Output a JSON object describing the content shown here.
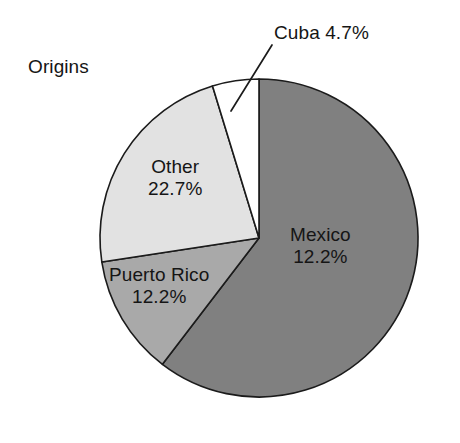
{
  "chart_data": {
    "type": "pie",
    "title": "Origins",
    "xlabel": "",
    "ylabel": "",
    "legend_position": "none",
    "grid": false,
    "categories": [
      "Mexico",
      "Puerto Rico",
      "Other",
      "Cuba"
    ],
    "values": [
      60.4,
      12.2,
      22.7,
      4.7
    ],
    "unit": "%",
    "start_angle_deg": 0,
    "direction": "clockwise",
    "slices": [
      {
        "name": "Mexico",
        "label": "Mexico",
        "value_label": "12.2%",
        "value": 60.4,
        "color": "#808080",
        "start_deg": 0,
        "end_deg": 217.4,
        "label_position": "inside"
      },
      {
        "name": "Puerto Rico",
        "label": "Puerto Rico",
        "value_label": "12.2%",
        "value": 12.2,
        "color": "#a9a9a9",
        "start_deg": 217.4,
        "end_deg": 261.3,
        "label_position": "inside"
      },
      {
        "name": "Other",
        "label": "Other",
        "value_label": "22.7%",
        "value": 22.7,
        "color": "#e2e2e2",
        "start_deg": 261.3,
        "end_deg": 343.0,
        "label_position": "inside"
      },
      {
        "name": "Cuba",
        "label": "Cuba 4.7%",
        "value_label": "4.7%",
        "value": 4.7,
        "color": "#ffffff",
        "start_deg": 343.0,
        "end_deg": 360.0,
        "label_position": "outside-leader"
      }
    ]
  },
  "chart": {
    "title": "Origins",
    "labels": {
      "origins": "Origins",
      "cuba": "Cuba 4.7%",
      "other_name": "Other",
      "other_value": "22.7%",
      "puerto_rico_name": "Puerto Rico",
      "puerto_rico_value": "12.2%",
      "mexico_name": "Mexico",
      "mexico_value": "12.2%"
    },
    "colors": {
      "mexico": "#808080",
      "puerto_rico": "#a9a9a9",
      "other": "#e2e2e2",
      "cuba": "#ffffff",
      "outline": "#1b1b1b",
      "text": "#151515",
      "background": "#ffffff"
    }
  }
}
